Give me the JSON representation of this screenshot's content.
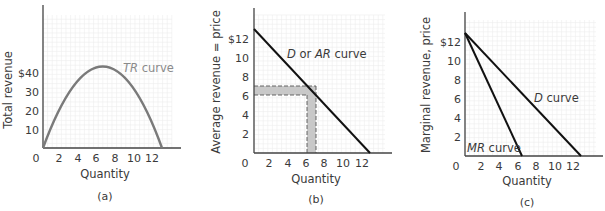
{
  "chart_data": [
    {
      "id": "a",
      "type": "line",
      "caption": "(a)",
      "title": "",
      "xlabel": "Quantity",
      "ylabel": "Total revenue",
      "x_ticks": [
        "0",
        "2",
        "4",
        "6",
        "8",
        "10",
        "12"
      ],
      "y_ticks": [
        "10",
        "20",
        "30",
        "$40"
      ],
      "xlim": [
        0,
        14
      ],
      "ylim": [
        0,
        75
      ],
      "grid": true,
      "series": [
        {
          "name": "TR curve",
          "color": "#8a8a8a",
          "x": [
            0,
            1,
            2,
            3,
            4,
            5,
            6,
            6.5,
            7,
            8,
            9,
            10,
            11,
            12,
            13
          ],
          "y": [
            0,
            12,
            22,
            30,
            36,
            40,
            42,
            42.25,
            42,
            40,
            36,
            30,
            22,
            12,
            0
          ]
        }
      ],
      "labels": {
        "curve": "TR curve",
        "curve_italic": "TR",
        "curve_rest": " curve"
      }
    },
    {
      "id": "b",
      "type": "line",
      "caption": "(b)",
      "title": "",
      "xlabel": "Quantity",
      "ylabel": "Average revenue = price",
      "x_ticks": [
        "0",
        "2",
        "4",
        "6",
        "8",
        "10",
        "12"
      ],
      "y_ticks": [
        "2",
        "4",
        "6",
        "8",
        "10",
        "$12"
      ],
      "xlim": [
        0,
        14
      ],
      "ylim": [
        0,
        14
      ],
      "grid": true,
      "series": [
        {
          "name": "D or AR curve",
          "color": "#111111",
          "x": [
            0,
            13
          ],
          "y": [
            13,
            0
          ]
        }
      ],
      "shaded_regions": [
        {
          "description": "horizontal band between price 6 and 7 from quantity 0 to 7",
          "x": [
            0,
            7
          ],
          "y": [
            6,
            7
          ],
          "color": "#c8c8c8"
        },
        {
          "description": "vertical band between quantity 6 and 7 from price 0 to 6",
          "x": [
            6,
            7
          ],
          "y": [
            0,
            6
          ],
          "color": "#c8c8c8"
        }
      ],
      "labels": {
        "curve_d": "D",
        "curve_mid": " or ",
        "curve_ar": "AR",
        "curve_rest": " curve"
      }
    },
    {
      "id": "c",
      "type": "line",
      "caption": "(c)",
      "title": "",
      "xlabel": "Quantity",
      "ylabel": "Marginal revenue, price",
      "x_ticks": [
        "0",
        "2",
        "4",
        "6",
        "8",
        "10",
        "12"
      ],
      "y_ticks": [
        "2",
        "4",
        "6",
        "8",
        "10",
        "$12"
      ],
      "xlim": [
        0,
        14
      ],
      "ylim": [
        0,
        14
      ],
      "grid": true,
      "series": [
        {
          "name": "D curve",
          "color": "#111111",
          "x": [
            0,
            13
          ],
          "y": [
            13,
            0
          ]
        },
        {
          "name": "MR curve",
          "color": "#111111",
          "x": [
            0,
            6.5
          ],
          "y": [
            13,
            0
          ]
        }
      ],
      "labels": {
        "d_italic": "D",
        "d_rest": " curve",
        "mr_italic": "MR",
        "mr_rest": " curve"
      }
    }
  ]
}
